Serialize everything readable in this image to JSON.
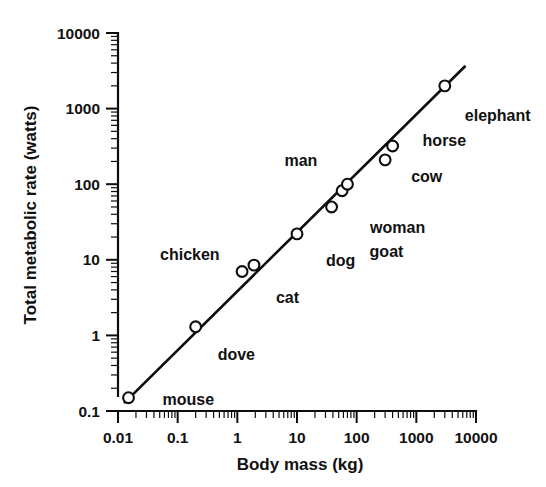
{
  "chart_data": {
    "type": "scatter",
    "title": "",
    "xlabel": "Body mass (kg)",
    "ylabel": "Total metabolic rate (watts)",
    "xscale": "log",
    "yscale": "log",
    "xlim": [
      0.01,
      10000
    ],
    "ylim": [
      0.1,
      10000
    ],
    "grid": false,
    "legend": "none",
    "x_tick_labels": [
      "0.01",
      "0.1",
      "1",
      "10",
      "100",
      "1000",
      "10000"
    ],
    "x_tick_values": [
      0.01,
      0.1,
      1,
      10,
      100,
      1000,
      10000
    ],
    "y_tick_labels": [
      "0.1",
      "1",
      "10",
      "100",
      "1000",
      "10000"
    ],
    "y_tick_values": [
      0.1,
      1,
      10,
      100,
      1000,
      10000
    ],
    "points": [
      {
        "label": "mouse",
        "x": 0.015,
        "y": 0.15,
        "label_dx": 34,
        "label_dy": 7
      },
      {
        "label": "dove",
        "x": 0.2,
        "y": 1.3,
        "label_dx": 22,
        "label_dy": 33
      },
      {
        "label": "chicken",
        "x": 1.2,
        "y": 7.0,
        "label_dx": -82,
        "label_dy": -12
      },
      {
        "label": "cat",
        "x": 1.9,
        "y": 8.5,
        "label_dx": 22,
        "label_dy": 38
      },
      {
        "label": "dog",
        "x": 10,
        "y": 22,
        "label_dx": 29,
        "label_dy": 32
      },
      {
        "label": "goat",
        "x": 38,
        "y": 50,
        "label_dx": 38,
        "label_dy": 50
      },
      {
        "label": "woman",
        "x": 57,
        "y": 82,
        "label_dx": 28,
        "label_dy": 42
      },
      {
        "label": "man",
        "x": 70,
        "y": 100,
        "label_dx": -63,
        "label_dy": -18
      },
      {
        "label": "cow",
        "x": 300,
        "y": 210,
        "label_dx": 26,
        "label_dy": 22
      },
      {
        "label": "horse",
        "x": 400,
        "y": 320,
        "label_dx": 30,
        "label_dy": 0
      },
      {
        "label": "elephant",
        "x": 3000,
        "y": 2000,
        "label_dx": 20,
        "label_dy": 35
      }
    ],
    "fit_line": {
      "description": "Kleiber allometric regression line",
      "x_start": 0.013,
      "y_start": 0.13,
      "x_end": 6500,
      "y_end": 3600
    },
    "colors": {
      "ink": "#0d0d0d",
      "background": "#ffffff",
      "marker_fill": "#ffffff"
    }
  }
}
